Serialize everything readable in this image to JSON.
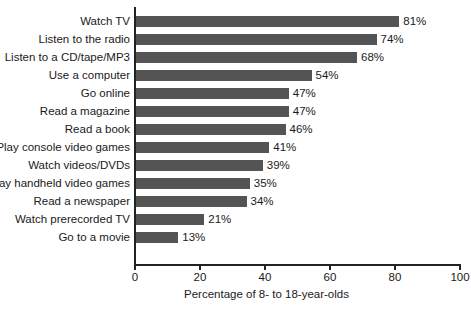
{
  "chart_data": {
    "type": "bar",
    "orientation": "horizontal",
    "title": "",
    "subtitle": "",
    "xlabel": "Percentage of 8- to 18-year-olds",
    "ylabel": "",
    "xlim": [
      0,
      100
    ],
    "xticks": [
      0,
      20,
      40,
      60,
      80,
      100
    ],
    "xticklabels": [
      "0",
      "20",
      "40",
      "60",
      "80",
      "100"
    ],
    "grid": false,
    "legend": false,
    "legend_position": "none",
    "bar_color": "#545454",
    "axis_color": "#232323",
    "background_color": "#ffffff",
    "value_label_suffix": "%",
    "categories": [
      "Watch TV",
      "Listen to the radio",
      "Listen to a CD/tape/MP3",
      "Use a computer",
      "Go online",
      "Read a magazine",
      "Read a book",
      "Play console video games",
      "Watch videos/DVDs",
      "Play handheld video games",
      "Read a newspaper",
      "Watch prerecorded TV",
      "Go to a movie"
    ],
    "values": [
      81,
      74,
      68,
      54,
      47,
      47,
      46,
      41,
      39,
      35,
      34,
      21,
      13
    ],
    "value_labels": [
      "81%",
      "74%",
      "68%",
      "54%",
      "47%",
      "47%",
      "46%",
      "41%",
      "39%",
      "35%",
      "34%",
      "21%",
      "13%"
    ]
  }
}
